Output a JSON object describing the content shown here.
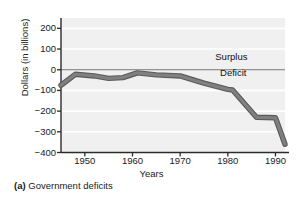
{
  "caption": {
    "tag": "(a)",
    "text": "Government deficits"
  },
  "chart_data": {
    "type": "line",
    "title": "",
    "subtitle": "",
    "xlabel": "Years",
    "ylabel": "Dollars (in billions)",
    "xlim": [
      1945,
      1992
    ],
    "ylim": [
      -400,
      250
    ],
    "xticks": [
      1950,
      1960,
      1970,
      1980,
      1990
    ],
    "xticklabels": [
      "1950",
      "1960",
      "1970",
      "1980",
      "1990"
    ],
    "yticks": [
      200,
      100,
      0,
      -100,
      -200,
      -300,
      -400
    ],
    "yticklabels": [
      "200",
      "100",
      "0",
      "−100",
      "−200",
      "−300",
      "−400"
    ],
    "grid": "horizontal",
    "grid_color": "#ffffff",
    "plot_background": "#f0f0f0",
    "legend": "none",
    "zero_line": 0,
    "annotations": [
      {
        "name": "surplus-label",
        "text": "Surplus",
        "x": 1978,
        "y": 60
      },
      {
        "name": "deficit-label",
        "text": "Deficit",
        "x": 1979,
        "y": -10
      }
    ],
    "series": [
      {
        "name": "Federal budget surplus/deficit",
        "color": "#808080",
        "outline_color": "#5a5a5a",
        "linewidth": 4,
        "x": [
          1945,
          1948,
          1952,
          1955,
          1958,
          1961,
          1965,
          1970,
          1975,
          1980,
          1981,
          1986,
          1990,
          1992
        ],
        "y": [
          -75,
          -22,
          -30,
          -42,
          -38,
          -15,
          -25,
          -30,
          -65,
          -95,
          -98,
          -230,
          -232,
          -360
        ]
      }
    ]
  }
}
